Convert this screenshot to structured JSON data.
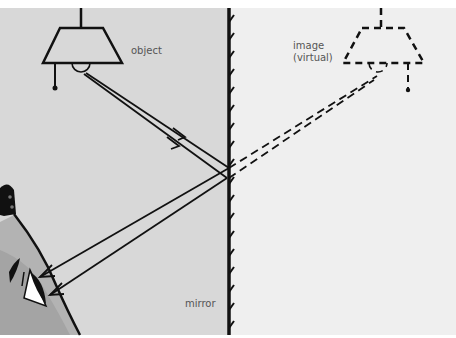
{
  "diagram": {
    "labels": {
      "object": "object",
      "image_line1": "image",
      "image_line2": "(virtual)",
      "mirror": "mirror"
    },
    "colors": {
      "left_bg": "#d8d8d8",
      "right_bg": "#efefef",
      "ink": "#111111",
      "face": "#a9a9a9",
      "label_text": "#555555"
    }
  }
}
